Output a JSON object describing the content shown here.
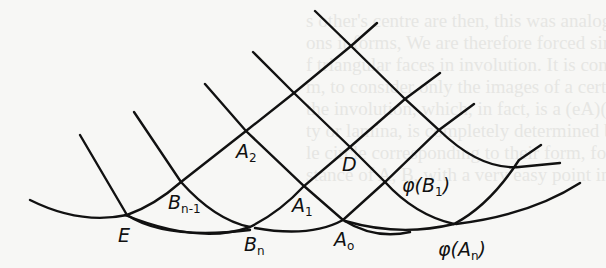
{
  "figure": {
    "stroke_color": "#111111",
    "background_color": "#f7f7f5",
    "labels": [
      {
        "id": "A2",
        "base": "A",
        "sub": "2",
        "x": 236,
        "y": 142
      },
      {
        "id": "D",
        "base": "D",
        "sub": "",
        "x": 342,
        "y": 155
      },
      {
        "id": "phiB1",
        "base": "φ(B",
        "sub": "1",
        "tail": ")",
        "x": 402,
        "y": 176
      },
      {
        "id": "Bn-1",
        "base": "B",
        "sub": "n-1",
        "x": 168,
        "y": 193
      },
      {
        "id": "A1",
        "base": "A",
        "sub": "1",
        "x": 292,
        "y": 196
      },
      {
        "id": "E",
        "base": "E",
        "sub": "",
        "x": 118,
        "y": 226
      },
      {
        "id": "Bn",
        "base": "B",
        "sub": "n",
        "x": 244,
        "y": 235
      },
      {
        "id": "A0",
        "base": "A",
        "sub": "o",
        "x": 334,
        "y": 230
      },
      {
        "id": "phiAn",
        "base": "φ(A",
        "sub": "n",
        "tail": ")",
        "x": 438,
        "y": 240
      }
    ]
  },
  "background_text": {
    "lines": [
      "s other's centre are then, this was analogous that of the",
      "ons it forms, We are therefore forced simultaneously to",
      "f triangular faces in involution. It is convenient, for our",
      "m, to consider only the images of a certain circle",
      "the involution, which, in fact, is a (eA)(Be)(B)",
      "ty or lamina, is completely determined by 3 at",
      "le circle corresponding to their form, for amusement",
      "stance of A, B, with a very easy point in the",
      "",
      ""
    ]
  }
}
